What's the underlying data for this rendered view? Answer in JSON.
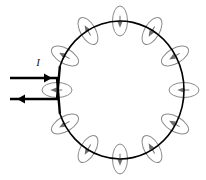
{
  "figure": {
    "type": "physics-diagram",
    "background_color": "#ffffff",
    "width": 206,
    "height": 180
  },
  "loop": {
    "name": "current-loop",
    "shape": "circle",
    "center_x": 120,
    "center_y": 90,
    "radius_x": 64,
    "radius_y": 69,
    "color": "#000000",
    "stroke_width": 1.6,
    "gap_start_deg": 160,
    "gap_end_deg": 200
  },
  "leads": {
    "name": "lead-wires",
    "color": "#000000",
    "stroke_width": 2.4,
    "top": {
      "label": "I",
      "label_x": 38,
      "label_y": 66,
      "y": 78,
      "x_start": 10,
      "x_end": 57,
      "arrow_direction": "right",
      "arrow_tip_x": 52,
      "arrow_y": 78
    },
    "bottom": {
      "label": "",
      "y": 99,
      "x_start": 10,
      "x_end": 57,
      "arrow_direction": "left",
      "arrow_tip_x": 17,
      "arrow_y": 99
    }
  },
  "field_lines": {
    "name": "magnetic-field-loops",
    "color": "#8a8a8a",
    "stroke_width": 1.0,
    "count": 12,
    "ellipse_rx": 7.5,
    "ellipse_ry": 15,
    "arrow_color": "#6e6e6e",
    "loops": [
      {
        "angle_deg": 270,
        "cx": 120,
        "cy": 21,
        "rotation_deg": 0,
        "arrow": "down"
      },
      {
        "angle_deg": 300,
        "cx": 152,
        "cy": 31,
        "rotation_deg": 30,
        "arrow": "down-left"
      },
      {
        "angle_deg": 330,
        "cx": 175,
        "cy": 56,
        "rotation_deg": 60,
        "arrow": "left-down"
      },
      {
        "angle_deg": 0,
        "cx": 184,
        "cy": 90,
        "rotation_deg": 90,
        "arrow": "left"
      },
      {
        "angle_deg": 30,
        "cx": 175,
        "cy": 124,
        "rotation_deg": 120,
        "arrow": "left-up"
      },
      {
        "angle_deg": 60,
        "cx": 152,
        "cy": 149,
        "rotation_deg": 150,
        "arrow": "up-left"
      },
      {
        "angle_deg": 90,
        "cx": 120,
        "cy": 159,
        "rotation_deg": 0,
        "arrow": "up"
      },
      {
        "angle_deg": 120,
        "cx": 88,
        "cy": 149,
        "rotation_deg": 30,
        "arrow": "up-right"
      },
      {
        "angle_deg": 150,
        "cx": 65,
        "cy": 124,
        "rotation_deg": 60,
        "arrow": "right-up"
      },
      {
        "angle_deg": 210,
        "cx": 65,
        "cy": 56,
        "rotation_deg": 120,
        "arrow": "right-down"
      },
      {
        "angle_deg": 240,
        "cx": 88,
        "cy": 31,
        "rotation_deg": 150,
        "arrow": "down-right"
      },
      {
        "angle_deg": 180,
        "cx": 57,
        "cy": 90,
        "rotation_deg": 90,
        "arrow": "right"
      }
    ]
  }
}
